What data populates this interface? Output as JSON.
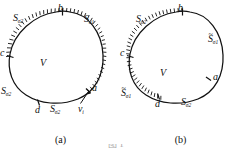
{
  "figure": {
    "caption_a": "(a)",
    "caption_b": "(b)",
    "bottom_cut_text": "图 1"
  },
  "panel_a": {
    "label": "(a)",
    "volume_label": "V",
    "points": [
      {
        "name": "b",
        "text": "b"
      },
      {
        "name": "c",
        "text": "c"
      },
      {
        "name": "d",
        "text": "d"
      },
      {
        "name": "a",
        "text": "a"
      }
    ],
    "surfaces": [
      {
        "name": "s-sigma2-top-left",
        "base": "S",
        "sub": "σ2",
        "tilde": false
      },
      {
        "name": "s-sigma1-top-right",
        "base": "S",
        "sub": "σ1",
        "tilde": false
      },
      {
        "name": "s-sigma2-left",
        "base": "S",
        "sub": "σ2",
        "tilde": false
      },
      {
        "name": "s-sigma2-bottom",
        "base": "S",
        "sub": "σ2",
        "tilde": false
      }
    ],
    "vector_label": {
      "base": "v",
      "sub": "i"
    },
    "hatched_arc": "b-to-c (upper-left boundary) and a-side right boundary"
  },
  "panel_b": {
    "label": "(b)",
    "volume_label": "V",
    "points": [
      {
        "name": "b",
        "text": "b"
      },
      {
        "name": "c",
        "text": "c"
      },
      {
        "name": "d",
        "text": "d"
      },
      {
        "name": "a",
        "text": "a"
      }
    ],
    "surfaces": [
      {
        "name": "s-sigma2-top-left",
        "base": "S",
        "sub": "σ2",
        "tilde": false
      },
      {
        "name": "s-tilde-sigma1-right",
        "base": "S",
        "sub": "σ1",
        "tilde": true
      },
      {
        "name": "s-tilde-sigma1-bottom-left",
        "base": "S",
        "sub": "σ1",
        "tilde": true
      },
      {
        "name": "s-sigma2-bottom",
        "base": "S",
        "sub": "σ2",
        "tilde": false
      }
    ],
    "hatched_arc": "b-through-c-to-d (left boundary)"
  },
  "colors": {
    "stroke": "#111111",
    "background": "#ffffff"
  }
}
